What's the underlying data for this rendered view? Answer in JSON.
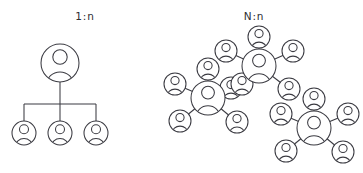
{
  "page": {
    "background_color": "#ffffff",
    "stroke_color": "#3b3b42",
    "text_color": "#2e2e33",
    "width": 363,
    "height": 173
  },
  "panels": [
    {
      "id": "one-to-many",
      "label": "1:n",
      "label_x": 85,
      "label_y": 16,
      "layout": "tree",
      "hub": {
        "cx": 60,
        "cy": 63,
        "r": 19
      },
      "bus_y": 104,
      "children": [
        {
          "cx": 24,
          "cy": 133,
          "r": 12
        },
        {
          "cx": 60,
          "cy": 133,
          "r": 12
        },
        {
          "cx": 96,
          "cy": 133,
          "r": 12
        }
      ],
      "node_count": 4,
      "link_count": 3
    },
    {
      "id": "many-to-many",
      "label": "N:n",
      "label_x": 254,
      "label_y": 16,
      "layout": "clusters",
      "clusters": [
        {
          "id": "cluster-top",
          "hub": {
            "cx": 259,
            "cy": 66,
            "r": 17
          },
          "satellites": [
            {
              "cx": 259,
              "cy": 37,
              "r": 11
            },
            {
              "cx": 293,
              "cy": 51,
              "r": 11
            },
            {
              "cx": 289,
              "cy": 89,
              "r": 11
            },
            {
              "cx": 231,
              "cy": 88,
              "r": 11
            },
            {
              "cx": 226,
              "cy": 51,
              "r": 11
            }
          ],
          "satellite_count": 5
        },
        {
          "id": "cluster-left",
          "hub": {
            "cx": 208,
            "cy": 98,
            "r": 17
          },
          "satellites": [
            {
              "cx": 208,
              "cy": 69,
              "r": 11
            },
            {
              "cx": 242,
              "cy": 84,
              "r": 11
            },
            {
              "cx": 237,
              "cy": 122,
              "r": 11
            },
            {
              "cx": 180,
              "cy": 121,
              "r": 11
            },
            {
              "cx": 175,
              "cy": 84,
              "r": 11
            }
          ],
          "satellite_count": 5
        },
        {
          "id": "cluster-bottom-right",
          "hub": {
            "cx": 314,
            "cy": 128,
            "r": 17
          },
          "satellites": [
            {
              "cx": 314,
              "cy": 99,
              "r": 11
            },
            {
              "cx": 348,
              "cy": 114,
              "r": 11
            },
            {
              "cx": 343,
              "cy": 152,
              "r": 11
            },
            {
              "cx": 286,
              "cy": 151,
              "r": 11
            },
            {
              "cx": 281,
              "cy": 114,
              "r": 11
            }
          ],
          "satellite_count": 5
        }
      ],
      "cluster_count": 3,
      "node_count": 18
    }
  ],
  "icons": {
    "person_icon_name": "person-avatar-icon",
    "description": "circle outline enclosing a small head circle and a shoulder arc"
  }
}
